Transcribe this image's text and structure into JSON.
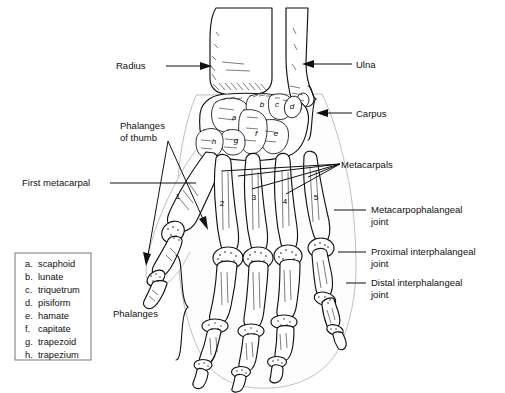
{
  "figure": {
    "background_color": "#ffffff",
    "line_color": "#111111"
  },
  "legend": {
    "name": "carpal-bones-key",
    "items": [
      {
        "key": "a.",
        "label": "scaphoid"
      },
      {
        "key": "b.",
        "label": "lunate"
      },
      {
        "key": "c.",
        "label": "triquetrum"
      },
      {
        "key": "d.",
        "label": "pisiform"
      },
      {
        "key": "e.",
        "label": "hamate"
      },
      {
        "key": "f.",
        "label": "capitate"
      },
      {
        "key": "g.",
        "label": "trapezoid"
      },
      {
        "key": "h.",
        "label": "trapezium"
      }
    ]
  },
  "labels": {
    "radius": "Radius",
    "ulna": "Ulna",
    "carpus": "Carpus",
    "metacarpals": "Metacarpals",
    "phalanges_of_thumb_line1": "Phalanges",
    "phalanges_of_thumb_line2": "of thumb",
    "first_metacarpal": "First metacarpal",
    "phalanges": "Phalanges",
    "mcp_joint_line1": "Metacarpophalangeal",
    "mcp_joint_line2": "joint",
    "pip_joint_line1": "Proximal interphalangeal",
    "pip_joint_line2": "joint",
    "dip_joint_line1": "Distal interphalangeal",
    "dip_joint_line2": "joint"
  },
  "carpal_markers": [
    {
      "id": "a",
      "x": 234,
      "y": 117
    },
    {
      "id": "b",
      "x": 262,
      "y": 104
    },
    {
      "id": "c",
      "x": 277,
      "y": 104
    },
    {
      "id": "d",
      "x": 292,
      "y": 106
    },
    {
      "id": "e",
      "x": 276,
      "y": 133
    },
    {
      "id": "f",
      "x": 256,
      "y": 133
    },
    {
      "id": "g",
      "x": 236,
      "y": 140
    },
    {
      "id": "h",
      "x": 214,
      "y": 141
    }
  ],
  "metacarpal_numbers": [
    {
      "id": "1",
      "x": 178,
      "y": 199
    },
    {
      "id": "2",
      "x": 222,
      "y": 206
    },
    {
      "id": "3",
      "x": 254,
      "y": 200
    },
    {
      "id": "4",
      "x": 285,
      "y": 204
    },
    {
      "id": "5",
      "x": 316,
      "y": 200
    }
  ]
}
